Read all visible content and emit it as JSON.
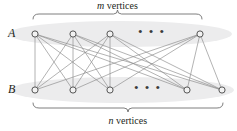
{
  "figure": {
    "type": "complete-bipartite-graph-diagram",
    "background_color": "#ffffff",
    "width": 237,
    "height": 131,
    "ink_color": "#231f20",
    "edge_color": "#8c8c8c",
    "vertex_fill": "#f2f2f2",
    "vertex_stroke": "#555555",
    "shade_color": "#ececed",
    "bracket_color": "#6f6f6f"
  },
  "labels": {
    "set_a": "A",
    "set_b": "B",
    "ellipsis": "• • •"
  },
  "brackets": {
    "top": {
      "variable": "m",
      "word": "vertices",
      "x_start": 33,
      "x_end": 202,
      "y": 14
    },
    "bottom": {
      "variable": "n",
      "word": "vertices",
      "x_start": 33,
      "x_end": 223,
      "y": 108
    }
  },
  "graph_data": {
    "type": "bipartite",
    "rows": [
      {
        "name": "A",
        "y": 34,
        "vertex_x": [
          35,
          73,
          110,
          200
        ],
        "ellipsis_x": 152,
        "shade": {
          "cx": 120,
          "cy": 34,
          "rx": 112,
          "ry": 13
        }
      },
      {
        "name": "B",
        "y": 90,
        "vertex_x": [
          35,
          73,
          110,
          187,
          222
        ],
        "ellipsis_x": 148,
        "shade": {
          "cx": 122,
          "cy": 90,
          "rx": 112,
          "ry": 13
        }
      }
    ],
    "vertex_radius": 3.1,
    "edges_description": "every A vertex joined to every B vertex",
    "edge_pairs": [
      [
        0,
        0
      ],
      [
        0,
        1
      ],
      [
        0,
        2
      ],
      [
        0,
        3
      ],
      [
        0,
        4
      ],
      [
        1,
        0
      ],
      [
        1,
        1
      ],
      [
        1,
        2
      ],
      [
        1,
        3
      ],
      [
        1,
        4
      ],
      [
        2,
        0
      ],
      [
        2,
        1
      ],
      [
        2,
        2
      ],
      [
        2,
        3
      ],
      [
        2,
        4
      ],
      [
        3,
        0
      ],
      [
        3,
        1
      ],
      [
        3,
        2
      ],
      [
        3,
        3
      ],
      [
        3,
        4
      ]
    ]
  }
}
